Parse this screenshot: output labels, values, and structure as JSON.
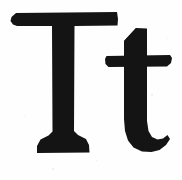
{
  "image": {
    "kind": "letterform-specimen",
    "caption": "Tt",
    "background_color": "#fefefe",
    "ink_color": "#141414",
    "width": 182,
    "height": 180
  },
  "glyphs": [
    {
      "id": "uppercase-t",
      "character": "T",
      "case": "uppercase",
      "style": "serif",
      "description": "Capital T with flat slab top bar and flared foot serif",
      "bounds": {
        "x": 11,
        "y": 12,
        "width": 107,
        "height": 142
      }
    },
    {
      "id": "lowercase-t",
      "character": "t",
      "case": "lowercase",
      "style": "serif",
      "description": "Lowercase t with angled ascender top, horizontal crossbar and curved bottom hook",
      "bounds": {
        "x": 106,
        "y": 28,
        "width": 66,
        "height": 124
      }
    }
  ],
  "specks": [
    {
      "x": 52,
      "y": 168,
      "size": 2
    },
    {
      "x": 151,
      "y": 94,
      "size": 2
    },
    {
      "x": 24,
      "y": 116,
      "size": 1
    },
    {
      "x": 167,
      "y": 38,
      "size": 1
    },
    {
      "x": 96,
      "y": 160,
      "size": 1
    }
  ]
}
